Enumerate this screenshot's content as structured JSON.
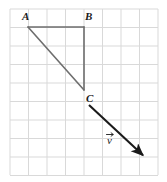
{
  "figure": {
    "background_color": "#ffffff",
    "grid": {
      "line_color": "#d9d9d9",
      "line_width": 1,
      "cell_size": 18.5,
      "columns": 8,
      "rows": 9,
      "x_start": 10,
      "y_start": 9,
      "x_end": 158,
      "y_end": 175
    },
    "triangle": {
      "name": "triangle-abc",
      "stroke_color": "#6e6e6e",
      "stroke_width": 1.6,
      "vertices": [
        {
          "label": "A",
          "x": 28,
          "y": 27,
          "label_x": 22,
          "label_y": 20
        },
        {
          "label": "B",
          "x": 84,
          "y": 27,
          "label_x": 85,
          "label_y": 20
        },
        {
          "label": "C",
          "x": 84,
          "y": 90,
          "label_x": 86,
          "label_y": 102
        }
      ],
      "edges": [
        {
          "name": "edge-ab",
          "from": "A",
          "to": "B"
        },
        {
          "name": "edge-bc",
          "from": "B",
          "to": "C"
        },
        {
          "name": "edge-ca",
          "from": "C",
          "to": "A"
        }
      ]
    },
    "vector": {
      "name": "vector-v",
      "label": "v",
      "label_x": 107,
      "label_y": 144,
      "stroke_color": "#1a1a1a",
      "stroke_width": 2.1,
      "start_x": 89,
      "start_y": 105,
      "end_x": 148,
      "end_y": 160,
      "arrowhead": "filled-triangle"
    },
    "labels": {
      "vertex_a": "A",
      "vertex_b": "B",
      "vertex_c": "C",
      "vector_v": "v",
      "label_color": "#1a1a1a",
      "label_font_size": 11
    }
  }
}
